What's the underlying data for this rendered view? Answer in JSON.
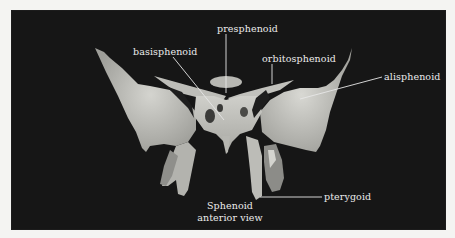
{
  "figure": {
    "caption": {
      "line1": "Sphenoid",
      "line2": "anterior view"
    },
    "labels": {
      "presphenoid": "presphenoid",
      "basisphenoid": "basisphenoid",
      "orbitosphenoid": "orbitosphenoid",
      "alisphenoid": "alisphenoid",
      "pterygoid": "pterygoid"
    },
    "colors": {
      "background": "#161616",
      "border": "#f4f4f2",
      "bone": "#c9c9c4",
      "label_text": "#ececec",
      "leader_line": "#e6e6e6"
    }
  }
}
